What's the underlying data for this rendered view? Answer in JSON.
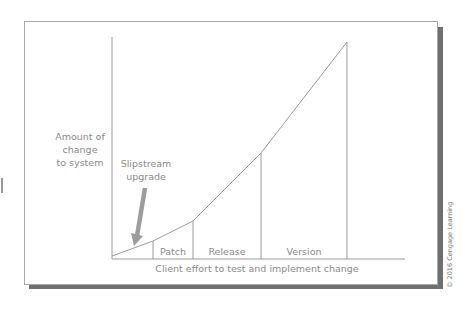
{
  "diagram": {
    "y_axis_label": "Amount of change to system",
    "y_axis_lines": [
      "Amount of",
      "change",
      "to system"
    ],
    "x_axis_label": "Client effort to test and implement change",
    "annotation": {
      "lines": [
        "Slipstream",
        "upgrade"
      ],
      "arrow": "down-left pointing to first segment"
    },
    "segments": [
      {
        "label": ""
      },
      {
        "label": "Patch"
      },
      {
        "label": "Release"
      },
      {
        "label": "Version"
      }
    ],
    "curve_points": [
      [
        112,
        256
      ],
      [
        153,
        241
      ],
      [
        193,
        221
      ],
      [
        261,
        153
      ],
      [
        347,
        42
      ]
    ],
    "colors": {
      "line": "#9a9a9a",
      "text": "#8a8a8a",
      "arrow": "#9c9c9c",
      "shadow": "#6f6f6f"
    }
  },
  "copyright": "© 2016 Cengage Learning"
}
